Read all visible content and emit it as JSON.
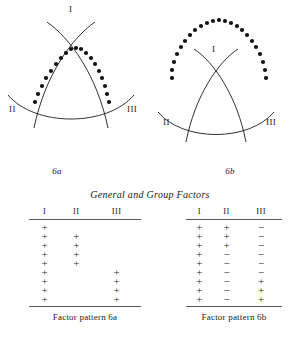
{
  "section": {
    "caption": "General and Group Factors"
  },
  "figures": [
    {
      "id": "6a",
      "caption": "6a",
      "axis_labels": {
        "top": "I",
        "left": "II",
        "right": "III"
      },
      "dot_overlay": "dots follow the left-and-right upper arcs forming a pointed arch",
      "dot_count": 19
    },
    {
      "id": "6b",
      "caption": "6b",
      "axis_labels": {
        "top": "I",
        "left": "II",
        "right": "III"
      },
      "dot_overlay": "dots form a wide arch outside and above the solid arcs",
      "dot_count": 25
    }
  ],
  "tables": [
    {
      "id": "factor-pattern-6a",
      "caption": "Factor pattern 6a",
      "columns": [
        "I",
        "II",
        "III"
      ],
      "rows": [
        [
          "+",
          "",
          ""
        ],
        [
          "+",
          "+",
          ""
        ],
        [
          "+",
          "+",
          ""
        ],
        [
          "+",
          "+",
          ""
        ],
        [
          "+",
          "+",
          ""
        ],
        [
          "+",
          "",
          "+"
        ],
        [
          "+",
          "",
          "+"
        ],
        [
          "+",
          "",
          "+"
        ],
        [
          "+",
          "",
          "+"
        ]
      ]
    },
    {
      "id": "factor-pattern-6b",
      "caption": "Factor pattern 6b",
      "columns": [
        "I",
        "II",
        "III"
      ],
      "rows": [
        [
          "+",
          "+",
          "−"
        ],
        [
          "+",
          "+",
          "−"
        ],
        [
          "+",
          "+",
          "−"
        ],
        [
          "+",
          "−",
          "−"
        ],
        [
          "+",
          "−",
          "−"
        ],
        [
          "+",
          "−",
          "−"
        ],
        [
          "+",
          "−",
          "+"
        ],
        [
          "+",
          "−",
          "+"
        ],
        [
          "+",
          "−",
          "+"
        ]
      ]
    }
  ],
  "colors": {
    "ink": "#1a1a1a",
    "rule": "#5a5a5a",
    "page": "#ffffff"
  }
}
